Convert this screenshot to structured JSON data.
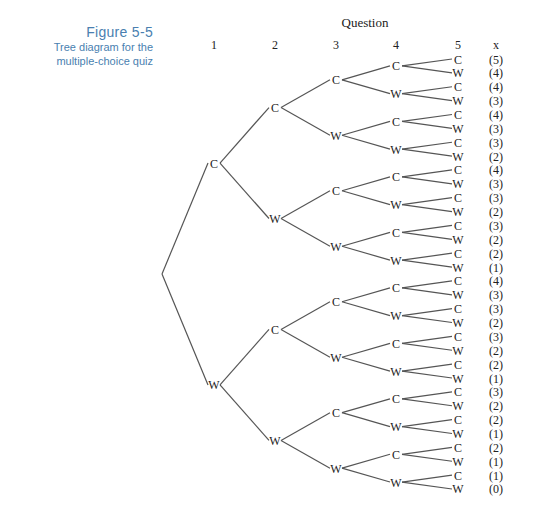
{
  "caption": {
    "figure": "Figure 5-5",
    "line1": "Tree diagram for the",
    "line2": "multiple-choice quiz"
  },
  "header": {
    "title": "Question",
    "columns": [
      "1",
      "2",
      "3",
      "4",
      "5"
    ],
    "score_label": "x"
  },
  "colors": {
    "caption": "#4a7fb0",
    "lines": "#555555",
    "text": "#222222"
  },
  "tree": {
    "branch_labels": [
      "C",
      "W"
    ],
    "leaf_scores": [
      "(5)",
      "(4)",
      "(4)",
      "(3)",
      "(4)",
      "(3)",
      "(3)",
      "(2)",
      "(4)",
      "(3)",
      "(3)",
      "(2)",
      "(3)",
      "(2)",
      "(2)",
      "(1)",
      "(4)",
      "(3)",
      "(3)",
      "(2)",
      "(3)",
      "(2)",
      "(2)",
      "(1)",
      "(3)",
      "(2)",
      "(2)",
      "(1)",
      "(2)",
      "(1)",
      "(1)",
      "(0)"
    ]
  }
}
